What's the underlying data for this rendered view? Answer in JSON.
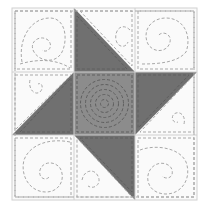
{
  "title": "Friendship Star quilt block",
  "block": {
    "x": 12,
    "y": 8,
    "size_w": 185,
    "size_h": 192,
    "grid": 3,
    "cols": [
      12,
      74,
      135,
      197
    ],
    "rows": [
      8,
      72,
      135,
      200
    ]
  },
  "colors": {
    "background": "#fafafa",
    "dark": "#707070",
    "center": "#8c8c8c",
    "seam": "#d4d4d4",
    "stitch_light": "#a8a8a8",
    "stitch_dark": "#5e5e5e"
  },
  "patches": [
    {
      "id": "top-left",
      "type": "plain",
      "quilting": "spiral"
    },
    {
      "id": "top-center",
      "type": "half-square-triangle",
      "dark_half": "lower-left"
    },
    {
      "id": "top-right",
      "type": "plain",
      "quilting": "spiral"
    },
    {
      "id": "middle-left",
      "type": "half-square-triangle",
      "dark_half": "lower-right"
    },
    {
      "id": "center",
      "type": "plain-dark",
      "quilting": "concentric-spiral"
    },
    {
      "id": "middle-right",
      "type": "half-square-triangle",
      "dark_half": "upper-left"
    },
    {
      "id": "bottom-left",
      "type": "plain",
      "quilting": "spiral"
    },
    {
      "id": "bottom-center",
      "type": "half-square-triangle",
      "dark_half": "upper-right"
    },
    {
      "id": "bottom-right",
      "type": "plain",
      "quilting": "spiral"
    }
  ]
}
